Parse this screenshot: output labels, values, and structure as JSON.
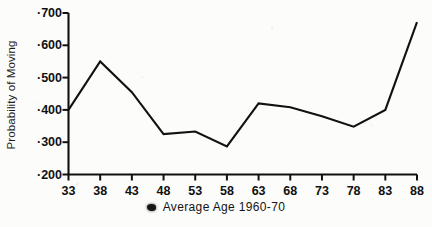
{
  "chart_data": {
    "type": "line",
    "title": "",
    "subtitle": "",
    "xlabel": "Average Age 1960-70",
    "ylabel": "Probability of Moving",
    "categories": [
      "33",
      "38",
      "43",
      "48",
      "53",
      "58",
      "63",
      "68",
      "73",
      "78",
      "83",
      "88"
    ],
    "x": [
      33,
      38,
      43,
      48,
      53,
      58,
      63,
      68,
      73,
      78,
      83,
      88
    ],
    "values": [
      0.4,
      0.55,
      0.455,
      0.325,
      0.333,
      0.287,
      0.42,
      0.408,
      0.38,
      0.348,
      0.4,
      0.672
    ],
    "series": [
      {
        "name": "Probability of Moving",
        "values": [
          0.4,
          0.55,
          0.455,
          0.325,
          0.333,
          0.287,
          0.42,
          0.408,
          0.38,
          0.348,
          0.4,
          0.672
        ]
      }
    ],
    "xlim": [
      33,
      88
    ],
    "ylim": [
      0.2,
      0.7
    ],
    "ytick_labels": [
      "·700",
      "·600",
      "·500",
      "·400",
      "·300",
      "·200"
    ],
    "ytick_values": [
      0.7,
      0.6,
      0.5,
      0.4,
      0.3,
      0.2
    ],
    "xtick_labels": [
      "33",
      "38",
      "43",
      "48",
      "53",
      "58",
      "63",
      "68",
      "73",
      "78",
      "83",
      "88"
    ],
    "grid": false,
    "legend": "none",
    "line_color": "#111111",
    "axis_color": "#111111",
    "background_color": "#fcfcfb"
  },
  "axes": {
    "y_axis_title": "Probability of Moving",
    "y_ticks": [
      {
        "label": "·700",
        "value": 0.7
      },
      {
        "label": "·600",
        "value": 0.6
      },
      {
        "label": "·500",
        "value": 0.5
      },
      {
        "label": "·400",
        "value": 0.4
      },
      {
        "label": "·300",
        "value": 0.3
      },
      {
        "label": "·200",
        "value": 0.2
      }
    ],
    "x_ticks": [
      {
        "label": "33"
      },
      {
        "label": "38"
      },
      {
        "label": "43"
      },
      {
        "label": "48"
      },
      {
        "label": "53"
      },
      {
        "label": "58"
      },
      {
        "label": "63"
      },
      {
        "label": "68"
      },
      {
        "label": "73"
      },
      {
        "label": "78"
      },
      {
        "label": "83"
      },
      {
        "label": "88"
      }
    ]
  },
  "caption": {
    "marker": "dot-smudge-marker",
    "text": "Average Age 1960-70"
  }
}
